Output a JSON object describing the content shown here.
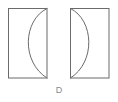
{
  "figure": {
    "label": "D",
    "label_color": "#8a8a8a",
    "background_color": "#ffffff",
    "stroke_color": "#6b6b6b",
    "stroke_width": 1,
    "shapes": [
      {
        "name": "left-crescent-square",
        "square": {
          "x": 8,
          "y": 8,
          "width": 39,
          "height": 70
        },
        "arc": {
          "start_x": 47,
          "start_y": 8,
          "end_x": 47,
          "end_y": 78,
          "bulge_direction": "left",
          "apex_x": 21,
          "apex_y": 43
        }
      },
      {
        "name": "right-crescent-square",
        "square": {
          "x": 70,
          "y": 8,
          "width": 39,
          "height": 70
        },
        "arc": {
          "start_x": 70,
          "start_y": 8,
          "end_x": 70,
          "end_y": 78,
          "bulge_direction": "right",
          "apex_x": 96,
          "apex_y": 43
        }
      }
    ]
  }
}
